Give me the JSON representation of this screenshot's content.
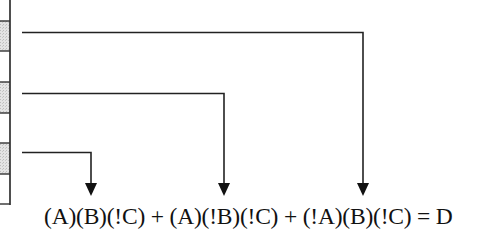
{
  "diagram": {
    "title": "",
    "formula": "(A)(B)(!C) + (A)(!B)(!C) + (!A)(B)(!C) = D",
    "terms": [
      "(A)(B)(!C)",
      "(A)(!B)(!C)",
      "(!A)(B)(!C)"
    ],
    "result": "D",
    "table": {
      "rows": [
        {
          "shaded": false
        },
        {
          "shaded": true
        },
        {
          "shaded": false
        },
        {
          "shaded": true
        },
        {
          "shaded": false
        },
        {
          "shaded": true
        },
        {
          "shaded": false
        }
      ]
    },
    "arrows": [
      {
        "from_row": 5,
        "to_term": 0
      },
      {
        "from_row": 3,
        "to_term": 1
      },
      {
        "from_row": 1,
        "to_term": 2
      }
    ],
    "colors": {
      "line": "#222222",
      "shade": "#d9d9d9",
      "text": "#111111"
    }
  }
}
